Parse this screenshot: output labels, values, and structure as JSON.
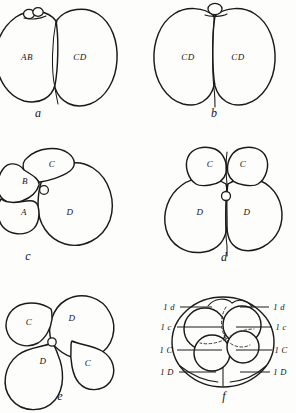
{
  "plate": {
    "title": "Cleavage stages plate",
    "background_color": "#fdfdfc",
    "ink_color": "#1a1a1a",
    "width": 296,
    "height": 413
  },
  "figures": [
    {
      "letter": "a",
      "stage_label": "two-cell stage, unequal",
      "cells": [
        {
          "label": "AB",
          "x": 27,
          "y": 57
        },
        {
          "label": "CD",
          "x": 80,
          "y": 57
        }
      ],
      "polar_bodies": 2,
      "letter_x": 38,
      "letter_y": 113
    },
    {
      "letter": "b",
      "stage_label": "two-cell stage, equal",
      "cells": [
        {
          "label": "CD",
          "x": 188,
          "y": 57
        },
        {
          "label": "CD",
          "x": 238,
          "y": 57
        }
      ],
      "polar_bodies": 1,
      "letter_x": 214,
      "letter_y": 113
    },
    {
      "letter": "c",
      "stage_label": "four-cell stage, quadrants A B C D",
      "cells": [
        {
          "label": "B",
          "x": 25,
          "y": 181
        },
        {
          "label": "C",
          "x": 52,
          "y": 164
        },
        {
          "label": "A",
          "x": 24,
          "y": 212
        },
        {
          "label": "D",
          "x": 70,
          "y": 212
        },
        {
          "label": "o",
          "x": 44,
          "y": 192
        }
      ],
      "polar_bodies": 0,
      "letter_x": 28,
      "letter_y": 256
    },
    {
      "letter": "d",
      "stage_label": "four-cell stage, C and D pairs",
      "cells": [
        {
          "label": "C",
          "x": 210,
          "y": 164
        },
        {
          "label": "C",
          "x": 243,
          "y": 164
        },
        {
          "label": "D",
          "x": 200,
          "y": 212
        },
        {
          "label": "D",
          "x": 247,
          "y": 212
        },
        {
          "label": "o",
          "x": 226,
          "y": 196
        }
      ],
      "polar_bodies": 0,
      "letter_x": 224,
      "letter_y": 257
    },
    {
      "letter": "e",
      "stage_label": "four-cell rosette",
      "cells": [
        {
          "label": "C",
          "x": 29,
          "y": 322
        },
        {
          "label": "D",
          "x": 72,
          "y": 318
        },
        {
          "label": "D",
          "x": 43,
          "y": 361
        },
        {
          "label": "C",
          "x": 88,
          "y": 363
        },
        {
          "label": "o",
          "x": 52,
          "y": 342
        }
      ],
      "polar_bodies": 0,
      "letter_x": 60,
      "letter_y": 396
    },
    {
      "letter": "f",
      "stage_label": "eight-cell stage with micromere quadrants",
      "cells": [],
      "polar_bodies": 0,
      "letter_x": 224,
      "letter_y": 396
    }
  ],
  "fig_f_leaders": {
    "left": [
      {
        "label": "1 d",
        "label_x": 169,
        "label_y": 307,
        "line_x1": 180,
        "line_x2": 212,
        "line_y": 307
      },
      {
        "label": "1 c",
        "label_x": 166,
        "label_y": 327,
        "line_x1": 177,
        "line_x2": 222,
        "line_y": 327
      },
      {
        "label": "1 C",
        "label_x": 166,
        "label_y": 350,
        "line_x1": 177,
        "line_x2": 222,
        "line_y": 350
      },
      {
        "label": "1 D",
        "label_x": 167,
        "label_y": 372,
        "line_x1": 179,
        "line_x2": 216,
        "line_y": 372
      }
    ],
    "right": [
      {
        "label": "1 d",
        "label_x": 279,
        "label_y": 307,
        "line_x1": 240,
        "line_x2": 269,
        "line_y": 307
      },
      {
        "label": "1 c",
        "label_x": 281,
        "label_y": 327,
        "line_x1": 236,
        "line_x2": 272,
        "line_y": 327
      },
      {
        "label": "1 C",
        "label_x": 281,
        "label_y": 350,
        "line_x1": 236,
        "line_x2": 272,
        "line_y": 350
      },
      {
        "label": "1 D",
        "label_x": 280,
        "label_y": 372,
        "line_x1": 240,
        "line_x2": 270,
        "line_y": 372
      }
    ]
  }
}
